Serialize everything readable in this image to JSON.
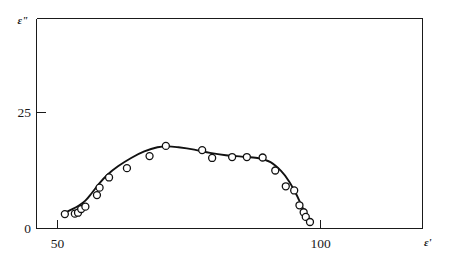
{
  "chart_data": {
    "type": "scatter",
    "title": "",
    "subtitle": "",
    "xlabel": "ε'",
    "ylabel": "ε\"",
    "xlim": [
      47.0,
      117.0
    ],
    "ylim": [
      0,
      39.0
    ],
    "xticks": [
      50,
      100
    ],
    "xticklabels": [
      "50",
      "100"
    ],
    "yticks": [
      0,
      25
    ],
    "yticklabels": [
      "0",
      "25"
    ],
    "grid": false,
    "legend": null,
    "legend_position": "none",
    "marker_style": "open-circle",
    "series": [
      {
        "name": "measured points",
        "type": "scatter",
        "x": [
          51.4,
          53.3,
          53.9,
          54.5,
          55.3,
          57.5,
          58.0,
          59.8,
          63.2,
          67.5,
          70.6,
          77.5,
          79.4,
          83.2,
          86.0,
          89.0,
          91.4,
          93.4,
          95.0,
          96.0,
          96.8,
          97.2,
          98.0
        ],
        "y": [
          3.1,
          3.2,
          3.4,
          4.2,
          4.7,
          7.2,
          8.8,
          11.0,
          13.0,
          15.6,
          17.8,
          16.9,
          15.2,
          15.4,
          15.4,
          15.3,
          12.5,
          9.1,
          8.2,
          5.0,
          3.5,
          2.5,
          1.4
        ]
      },
      {
        "name": "fitted curve",
        "type": "line",
        "x": [
          51.2,
          52.5,
          54.0,
          55.3,
          56.5,
          58.0,
          59.5,
          61.5,
          64.0,
          66.5,
          69.0,
          71.0,
          73.0,
          76.0,
          79.0,
          82.0,
          85.0,
          88.0,
          90.5,
          92.5,
          94.0,
          95.3,
          96.3,
          97.2,
          98.0
        ],
        "y": [
          3.3,
          4.0,
          4.9,
          6.0,
          7.6,
          9.8,
          11.6,
          13.4,
          15.2,
          16.6,
          17.5,
          17.7,
          17.5,
          17.0,
          16.3,
          15.8,
          15.5,
          15.2,
          14.3,
          12.4,
          10.2,
          7.6,
          5.2,
          3.0,
          1.2
        ]
      }
    ]
  },
  "axes": {
    "y_axis_label": "ε\"",
    "x_axis_label": "ε'",
    "y_tick_0": "0",
    "y_tick_25": "25",
    "x_tick_50": "50",
    "x_tick_100": "100"
  },
  "colors": {
    "line": "#111111",
    "marker_stroke": "#111111",
    "marker_fill": "#ffffff",
    "axis": "#1a1a1a",
    "background": "#ffffff"
  }
}
